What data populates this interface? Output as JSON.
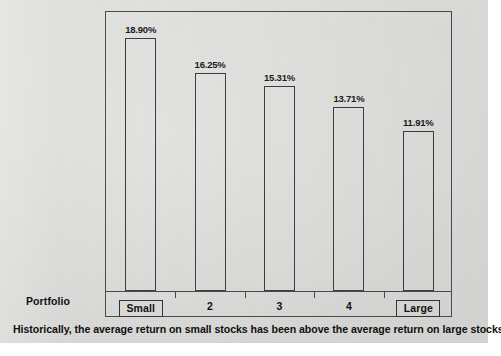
{
  "figure": {
    "background_color": "#dcdcda",
    "frame_color": "#4a4a4a",
    "bar_outline_color": "#3c3c3c",
    "text_color": "#111111",
    "caption": "Historically, the average return on small stocks has been above the average return on large stocks.",
    "axis_row_label": "Portfolio"
  },
  "chart_data": {
    "type": "bar",
    "title": "",
    "subtitle": "",
    "xlabel": "Portfolio",
    "ylabel": "",
    "categories": [
      "Small",
      "2",
      "3",
      "4",
      "Large"
    ],
    "values": [
      18.9,
      16.25,
      15.31,
      13.71,
      11.91
    ],
    "data_labels": [
      "18.90%",
      "16.25%",
      "15.31%",
      "13.71%",
      "11.91%"
    ],
    "boxed_categories": [
      "Small",
      "Large"
    ],
    "ylim": [
      0,
      20.8
    ],
    "grid": false,
    "legend": null,
    "legend_position": "none",
    "bar_fill": "none",
    "annotations": [
      "Historically, the average return on small stocks has been above the average return on large stocks."
    ]
  }
}
